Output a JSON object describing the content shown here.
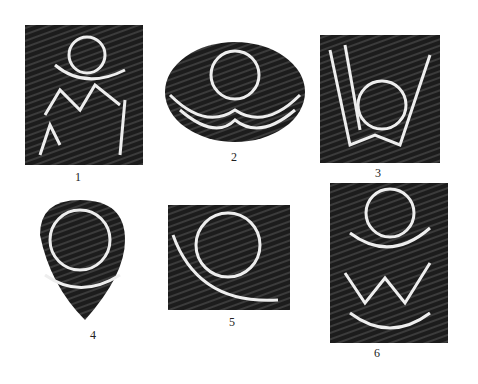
{
  "figure": {
    "panels": [
      {
        "label": "1",
        "subject": "circle-head figure with arc and zigzag body"
      },
      {
        "label": "2",
        "subject": "circle above double crescent"
      },
      {
        "label": "3",
        "subject": "circle inside V-shaped lines"
      },
      {
        "label": "4",
        "subject": "circle in rounded teardrop shape"
      },
      {
        "label": "5",
        "subject": "circle within square frame"
      },
      {
        "label": "6",
        "subject": "circle over crescent above zigzag"
      }
    ],
    "colors": {
      "background": "#ffffff",
      "stone": "#1a1a1a",
      "groove": "#f2f2f2"
    }
  }
}
